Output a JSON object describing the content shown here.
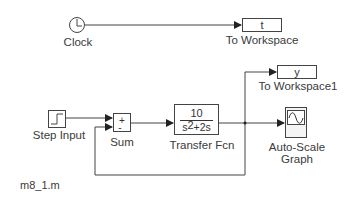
{
  "diagram": {
    "type": "simulink-block-diagram",
    "footer_label": "m8_1.m",
    "blocks": {
      "clock": {
        "label": "Clock",
        "icon": "clock-icon"
      },
      "to_workspace": {
        "label": "To Workspace",
        "variable": "t"
      },
      "to_workspace1": {
        "label": "To Workspace1",
        "variable": "y"
      },
      "step_input": {
        "label": "Step Input",
        "icon": "step-icon"
      },
      "sum": {
        "label": "Sum",
        "signs": [
          "+",
          "-"
        ]
      },
      "transfer_fcn": {
        "label": "Transfer Fcn",
        "numerator": "10",
        "denominator_s": "s",
        "denominator_exp": "2",
        "denominator_rest": "+2s"
      },
      "scope": {
        "label_line1": "Auto-Scale",
        "label_line2": "Graph",
        "icon": "sine-wave-icon"
      }
    },
    "connections": [
      {
        "from": "Clock",
        "to": "To Workspace"
      },
      {
        "from": "Step Input",
        "to": "Sum (+)"
      },
      {
        "from": "Sum",
        "to": "Transfer Fcn"
      },
      {
        "from": "Transfer Fcn",
        "to": "Auto-Scale Graph"
      },
      {
        "from": "Transfer Fcn",
        "to": "To Workspace1"
      },
      {
        "from": "Transfer Fcn",
        "to": "Sum (-)",
        "kind": "feedback"
      }
    ]
  }
}
